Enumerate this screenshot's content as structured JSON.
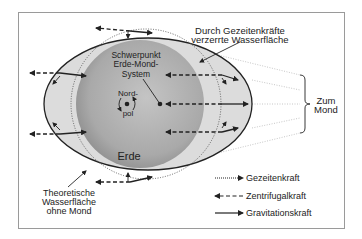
{
  "labels": {
    "distorted_water_line1": "Durch Gezeitenkräfte",
    "distorted_water_line2": "verzerrte Wasserfläche",
    "barycenter_line1": "Schwerpunkt",
    "barycenter_line2": "Erde-Mond-",
    "barycenter_line3": "System",
    "north_pole_line1": "Nord-",
    "north_pole_line2": "pol",
    "earth": "Erde",
    "to_moon_line1": "Zum",
    "to_moon_line2": "Mond",
    "theoretical_line1": "Theoretische",
    "theoretical_line2": "Wasserfläche",
    "theoretical_line3": "ohne Mond"
  },
  "legend": {
    "items": [
      {
        "label": "Gezeitenkraft",
        "style": "dotted"
      },
      {
        "label": "Zentrifugalkraft",
        "style": "dashed"
      },
      {
        "label": "Gravitationskraft",
        "style": "solid"
      }
    ]
  },
  "colors": {
    "frame": "#9a9a9a",
    "water": "#d9d9d9",
    "earth_light": "#bdbdbd",
    "earth_dark": "#8f8f8f",
    "ink": "#222222"
  }
}
